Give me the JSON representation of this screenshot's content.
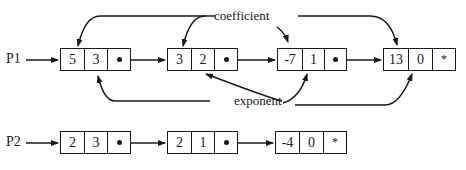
{
  "labels": {
    "coefficient": "coefficient",
    "exponent": "exponent"
  },
  "lists": [
    {
      "name": "P1",
      "nodes": [
        {
          "coefficient": "5",
          "exponent": "3",
          "link": "•"
        },
        {
          "coefficient": "3",
          "exponent": "2",
          "link": "•"
        },
        {
          "coefficient": "-7",
          "exponent": "1",
          "link": "•"
        },
        {
          "coefficient": "13",
          "exponent": "0",
          "link": "*"
        }
      ]
    },
    {
      "name": "P2",
      "nodes": [
        {
          "coefficient": "2",
          "exponent": "3",
          "link": "•"
        },
        {
          "coefficient": "2",
          "exponent": "1",
          "link": "•"
        },
        {
          "coefficient": "-4",
          "exponent": "0",
          "link": "*"
        }
      ]
    }
  ],
  "colors": {
    "ink": "#1a1a1a",
    "background": "#ffffff"
  }
}
